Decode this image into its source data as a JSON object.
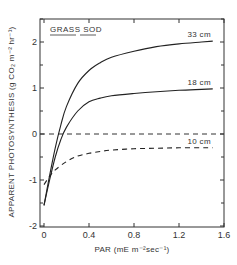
{
  "chart_data": {
    "type": "line",
    "title": "",
    "inset_label": "GRASS SOD",
    "xlabel": "PAR (mE m⁻²sec⁻¹)",
    "ylabel": "APPARENT  PHOTOSYNTHESIS (g CO₂ m⁻² hr⁻¹)",
    "xlim": [
      0,
      1.6
    ],
    "ylim": [
      -2,
      2.6
    ],
    "x_ticks": [
      0,
      0.4,
      0.8,
      1.2,
      1.6
    ],
    "x_tick_labels": [
      "0",
      "0.4",
      "0.8",
      "1.2",
      "1.6"
    ],
    "y_ticks": [
      -2,
      -1,
      0,
      1,
      2
    ],
    "y_tick_labels": [
      "-2",
      "-1",
      "0",
      "1",
      "2"
    ],
    "grid": false,
    "reference_line": {
      "y": 0,
      "style": "dashed"
    },
    "series": [
      {
        "name": "33 cm",
        "style": "solid",
        "x": [
          0.0,
          0.05,
          0.1,
          0.15,
          0.2,
          0.3,
          0.4,
          0.5,
          0.6,
          0.8,
          1.0,
          1.2,
          1.4,
          1.5
        ],
        "y": [
          -1.55,
          -0.9,
          -0.3,
          0.2,
          0.6,
          1.1,
          1.38,
          1.55,
          1.67,
          1.8,
          1.9,
          1.96,
          2.0,
          2.02
        ]
      },
      {
        "name": "18 cm",
        "style": "solid",
        "x": [
          0.0,
          0.05,
          0.1,
          0.15,
          0.2,
          0.3,
          0.4,
          0.5,
          0.6,
          0.8,
          1.0,
          1.2,
          1.4,
          1.5
        ],
        "y": [
          -1.55,
          -1.0,
          -0.5,
          -0.12,
          0.15,
          0.5,
          0.7,
          0.78,
          0.83,
          0.88,
          0.92,
          0.95,
          0.97,
          0.98
        ]
      },
      {
        "name": "10 cm",
        "style": "dashed",
        "x": [
          0.0,
          0.05,
          0.1,
          0.2,
          0.3,
          0.4,
          0.5,
          0.6,
          0.8,
          1.0,
          1.2,
          1.4,
          1.5
        ],
        "y": [
          -1.1,
          -0.92,
          -0.78,
          -0.6,
          -0.48,
          -0.42,
          -0.38,
          -0.35,
          -0.32,
          -0.31,
          -0.3,
          -0.3,
          -0.3
        ]
      }
    ],
    "annotations": [
      {
        "text": "33 cm",
        "series": "33 cm"
      },
      {
        "text": "18 cm",
        "series": "18 cm"
      },
      {
        "text": "10 cm",
        "series": "10 cm"
      }
    ]
  }
}
